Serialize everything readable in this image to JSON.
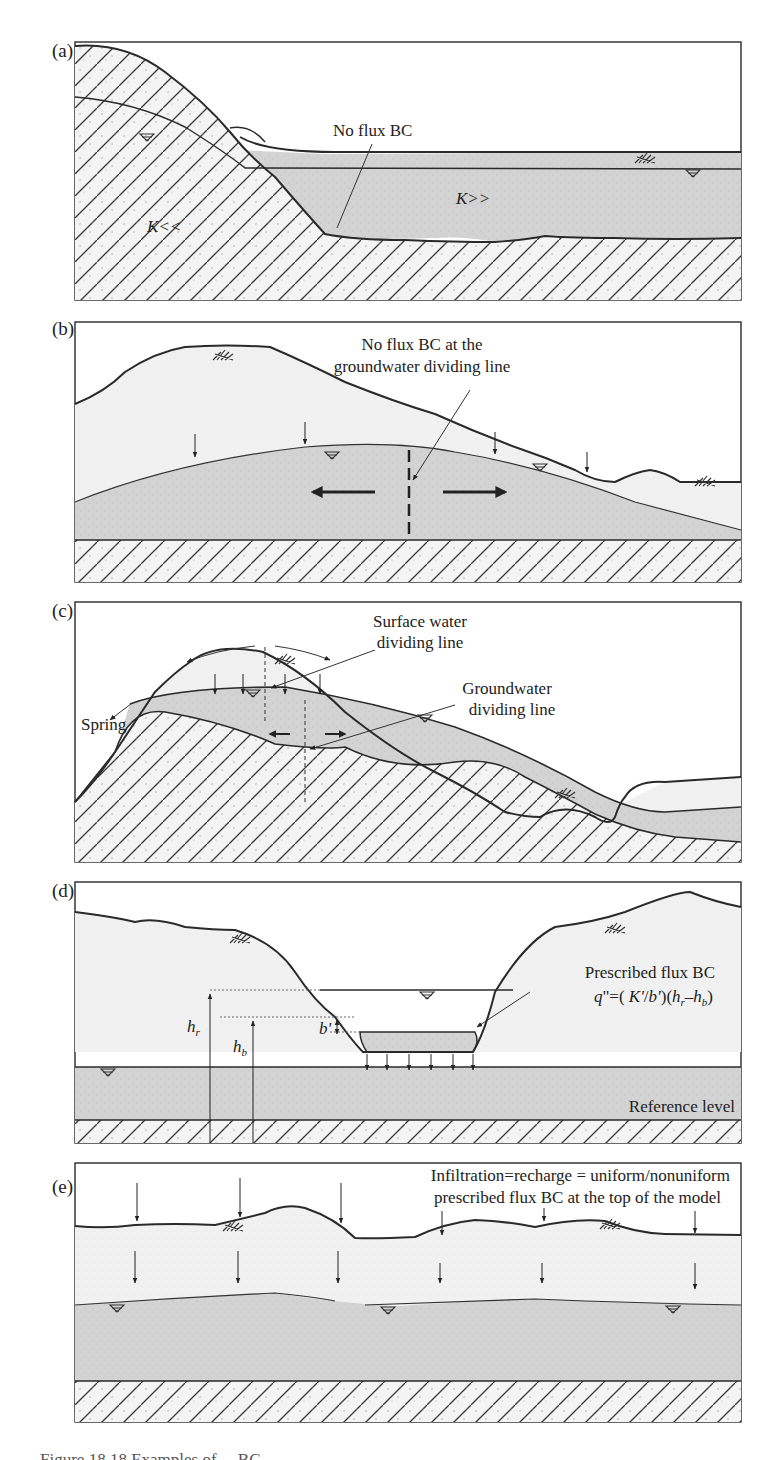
{
  "figure": {
    "colors": {
      "outline": "#2a2a2a",
      "unsaturated_fill": "#f1f1f1",
      "saturated_fill": "#d3d3d3",
      "bedrock_fill": "#f4f4f4",
      "hatch": "#3a3a3a"
    },
    "panels": [
      {
        "id": "a",
        "label": "(a)",
        "annotations": {
          "callout": "No flux BC",
          "k_low": "K<<",
          "k_high": "K>>"
        },
        "symbols": [
          "water-table-icon",
          "water-table-icon",
          "vegetation-icon"
        ]
      },
      {
        "id": "b",
        "label": "(b)",
        "annotations": {
          "callout_line1": "No flux BC at the",
          "callout_line2": "groundwater dividing line"
        },
        "symbols": [
          "vegetation-icon",
          "vegetation-icon",
          "water-table-icon",
          "water-table-icon"
        ]
      },
      {
        "id": "c",
        "label": "(c)",
        "annotations": {
          "surface_line1": "Surface water",
          "surface_line2": "dividing line",
          "ground_line1": "Groundwater",
          "ground_line2": "dividing line",
          "spring": "Spring"
        },
        "symbols": [
          "vegetation-icon",
          "vegetation-icon",
          "water-table-icon",
          "water-table-icon"
        ]
      },
      {
        "id": "d",
        "label": "(d)",
        "annotations": {
          "callout_line1": "Prescribed flux BC",
          "formula": "q\"=( K'/b')(hr−hb)",
          "formula_parts": {
            "q": "q",
            "eq": "\"=(",
            "K": " K'",
            "slash": "/",
            "b": "b'",
            "mid": ")(",
            "hr": "h",
            "r": "r",
            "minus": "–",
            "hb": "h",
            "b_sub": "b",
            "close": ")"
          },
          "h_r": "h",
          "h_r_sub": "r",
          "h_b": "h",
          "h_b_sub": "b",
          "b_prime": "b'",
          "reference": "Reference level"
        },
        "symbols": [
          "vegetation-icon",
          "vegetation-icon",
          "water-table-icon",
          "water-table-icon"
        ]
      },
      {
        "id": "e",
        "label": "(e)",
        "annotations": {
          "callout_line1": "Infiltration=recharge = uniform/nonuniform",
          "callout_line2": "prescribed flux BC at the top of the model"
        },
        "symbols": [
          "vegetation-icon",
          "vegetation-icon",
          "water-table-icon",
          "water-table-icon",
          "water-table-icon"
        ]
      }
    ],
    "caption_partial": "Figure 18.18  Examples of ...  BC ..."
  }
}
